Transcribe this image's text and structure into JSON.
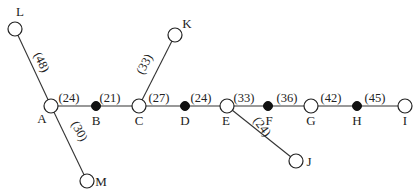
{
  "diagram": {
    "type": "tree-network",
    "nodes": [
      {
        "id": "A",
        "label": "A",
        "x": 51,
        "y": 106,
        "style": "open",
        "label_dx": -9,
        "label_dy": 17
      },
      {
        "id": "B",
        "label": "B",
        "x": 96,
        "y": 106,
        "style": "filled",
        "label_dx": 0,
        "label_dy": 19
      },
      {
        "id": "C",
        "label": "C",
        "x": 139,
        "y": 106,
        "style": "open",
        "label_dx": 0,
        "label_dy": 19
      },
      {
        "id": "D",
        "label": "D",
        "x": 185,
        "y": 106,
        "style": "filled",
        "label_dx": 0,
        "label_dy": 19
      },
      {
        "id": "E",
        "label": "E",
        "x": 227,
        "y": 106,
        "style": "open",
        "label_dx": -1,
        "label_dy": 19
      },
      {
        "id": "F",
        "label": "F",
        "x": 268,
        "y": 106,
        "style": "filled",
        "label_dx": 1,
        "label_dy": 19
      },
      {
        "id": "G",
        "label": "G",
        "x": 311,
        "y": 106,
        "style": "open",
        "label_dx": 0,
        "label_dy": 19
      },
      {
        "id": "H",
        "label": "H",
        "x": 357,
        "y": 106,
        "style": "filled",
        "label_dx": 0,
        "label_dy": 19
      },
      {
        "id": "I",
        "label": "I",
        "x": 405,
        "y": 106,
        "style": "open",
        "label_dx": 0,
        "label_dy": 19
      },
      {
        "id": "L",
        "label": "L",
        "x": 15,
        "y": 29,
        "style": "open",
        "label_dx": 5,
        "label_dy": -13
      },
      {
        "id": "K",
        "label": "K",
        "x": 175,
        "y": 35,
        "style": "open",
        "label_dx": 12,
        "label_dy": -7
      },
      {
        "id": "M",
        "label": "M",
        "x": 87,
        "y": 181,
        "style": "open",
        "label_dx": 14,
        "label_dy": 5
      },
      {
        "id": "J",
        "label": "J",
        "x": 296,
        "y": 161,
        "style": "open",
        "label_dx": 13,
        "label_dy": 5
      }
    ],
    "edges": [
      {
        "from": "L",
        "to": "A",
        "weight": "(48)",
        "lx": 38,
        "ly": 64,
        "rot": 64
      },
      {
        "from": "A",
        "to": "M",
        "weight": "(30)",
        "lx": 76,
        "ly": 133,
        "rot": 62
      },
      {
        "from": "A",
        "to": "B",
        "weight": "(24)",
        "lx": 69,
        "ly": 102,
        "rot": 0
      },
      {
        "from": "B",
        "to": "C",
        "weight": "(21)",
        "lx": 110,
        "ly": 102,
        "rot": 0
      },
      {
        "from": "C",
        "to": "K",
        "weight": "(33)",
        "lx": 148,
        "ly": 66,
        "rot": -62
      },
      {
        "from": "C",
        "to": "D",
        "weight": "(27)",
        "lx": 159,
        "ly": 102,
        "rot": 0
      },
      {
        "from": "D",
        "to": "E",
        "weight": "(24)",
        "lx": 201,
        "ly": 102,
        "rot": 0
      },
      {
        "from": "E",
        "to": "F",
        "weight": "(33)",
        "lx": 244,
        "ly": 102,
        "rot": 0
      },
      {
        "from": "E",
        "to": "J",
        "weight": "(24)",
        "lx": 259,
        "ly": 129,
        "rot": 54
      },
      {
        "from": "F",
        "to": "G",
        "weight": "(36)",
        "lx": 287,
        "ly": 102,
        "rot": 0
      },
      {
        "from": "G",
        "to": "H",
        "weight": "(42)",
        "lx": 331,
        "ly": 102,
        "rot": 0
      },
      {
        "from": "H",
        "to": "I",
        "weight": "(45)",
        "lx": 375,
        "ly": 102,
        "rot": 0
      }
    ],
    "node_radius": {
      "open": 7,
      "filled": 4.5
    },
    "colors": {
      "line": "#333333",
      "filled_node": "#111111",
      "open_node_fill": "#ffffff",
      "text": "#222222"
    }
  }
}
